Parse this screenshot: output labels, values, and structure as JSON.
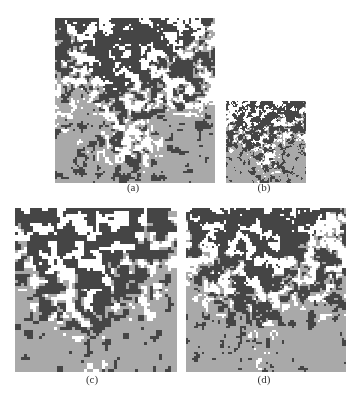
{
  "figure": {
    "panels": [
      {
        "id": "a",
        "label": "(a)",
        "x": 55,
        "y": 18,
        "w": 160,
        "h": 165,
        "seed": 11,
        "scale": 2,
        "cap_x": 118,
        "cap_y": 181
      },
      {
        "id": "b",
        "label": "(b)",
        "x": 226,
        "y": 101,
        "w": 80,
        "h": 82,
        "seed": 23,
        "scale": 1,
        "cap_x": 249,
        "cap_y": 181
      },
      {
        "id": "c",
        "label": "(c)",
        "x": 15,
        "y": 208,
        "w": 162,
        "h": 164,
        "seed": 37,
        "scale": 3,
        "cap_x": 77,
        "cap_y": 373
      },
      {
        "id": "d",
        "label": "(d)",
        "x": 186,
        "y": 208,
        "w": 160,
        "h": 164,
        "seed": 53,
        "scale": 2,
        "cap_x": 249,
        "cap_y": 373
      }
    ],
    "classes": [
      {
        "name": "white-class",
        "color": "#ffffff"
      },
      {
        "name": "gray-class",
        "color": "#a9a9a9"
      },
      {
        "name": "dark-class",
        "color": "#454545"
      }
    ]
  }
}
